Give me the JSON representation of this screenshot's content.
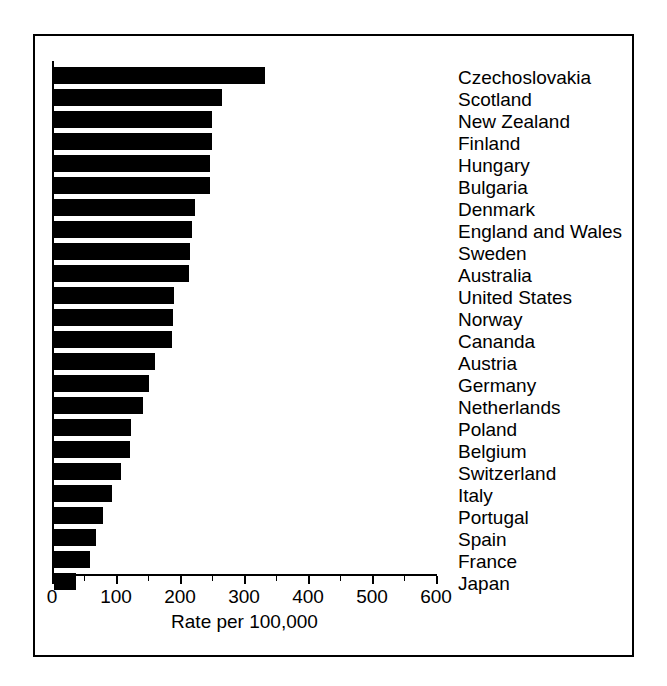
{
  "chart_data": {
    "type": "bar",
    "orientation": "horizontal",
    "title": "",
    "xlabel": "Rate per 100,000",
    "ylabel": "",
    "xlim": [
      0,
      640
    ],
    "grid": false,
    "legend": null,
    "axis": {
      "major_ticks": [
        0,
        100,
        200,
        300,
        400,
        500,
        600
      ],
      "major_tick_labels": [
        "0",
        "100",
        "200",
        "300",
        "400",
        "500",
        "600"
      ],
      "minor_tick_interval": 50
    },
    "categories": [
      "Czechoslovakia",
      "Scotland",
      "New Zealand",
      "Finland",
      "Hungary",
      "Bulgaria",
      "Denmark",
      "England and Wales",
      "Sweden",
      "Australia",
      "United States",
      "Norway",
      "Cananda",
      "Austria",
      "Germany",
      "Netherlands",
      "Poland",
      "Belgium",
      "Switzerland",
      "Italy",
      "Portugal",
      "Spain",
      "France",
      "Japan"
    ],
    "values": [
      330,
      262,
      247,
      247,
      243,
      243,
      220,
      215,
      212,
      211,
      187,
      186,
      185,
      158,
      149,
      139,
      121,
      119,
      105,
      90,
      76,
      65,
      56,
      34
    ]
  },
  "colors": {
    "bar": "#000000",
    "axis": "#000000",
    "background": "#ffffff",
    "frame": "#000000"
  }
}
